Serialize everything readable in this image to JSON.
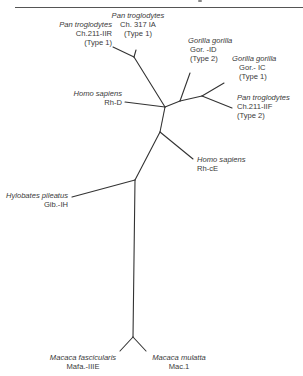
{
  "diagram": {
    "type": "unrooted phylogenetic tree",
    "edge_color": "#333333",
    "leaves": [
      {
        "id": "pan_iir",
        "species": "Pan troglodytes",
        "lines": [
          "Ch.211-IIR",
          "(Type 1)"
        ]
      },
      {
        "id": "pan_317",
        "species": "Pan troglodytes",
        "lines": [
          "Ch. 317 IA",
          "(Type 1)"
        ]
      },
      {
        "id": "gor_id",
        "species": "Gorilla gorilla",
        "lines": [
          "Gor. -ID",
          "(Type 2)"
        ]
      },
      {
        "id": "gor_ic",
        "species": "Gorilla gorilla",
        "lines": [
          "Gor.- IC",
          "(Type 1)"
        ]
      },
      {
        "id": "pan_iif",
        "species": "Pan troglodytes",
        "lines": [
          "Ch.211-IIF",
          "(Type 2)"
        ]
      },
      {
        "id": "homo_rhd",
        "species": "Homo sapiens",
        "lines": [
          "Rh-D"
        ]
      },
      {
        "id": "homo_rhce",
        "species": "Homo sapiens",
        "lines": [
          "Rh-cE"
        ]
      },
      {
        "id": "hylo",
        "species": "Hylobates pileatus",
        "lines": [
          "Gib.-IH"
        ]
      },
      {
        "id": "mafa",
        "species": "Macaca fascicularis",
        "lines": [
          "Mafa.-IIIE"
        ]
      },
      {
        "id": "mac",
        "species": "Macaca mulatta",
        "lines": [
          "Mac.1"
        ]
      }
    ]
  }
}
